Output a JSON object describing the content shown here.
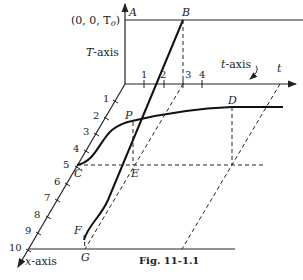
{
  "figure": {
    "caption": "Fig. 11-1.1",
    "origin_label": "(0, 0, T",
    "origin_sub": "0",
    "origin_close": ")",
    "axes": {
      "T_axis": "T-axis",
      "t_axis": "t-axis",
      "t_end": "t",
      "x_axis_var": "x",
      "x_axis_suffix": "-axis"
    },
    "t_ticks": [
      "1",
      "2",
      "3",
      "4"
    ],
    "x_ticks": [
      "1",
      "2",
      "3",
      "4",
      "5",
      "6",
      "7",
      "8",
      "9",
      "10"
    ],
    "points": {
      "A": "A",
      "B": "B",
      "C": "C",
      "D": "D",
      "E": "E",
      "F": "F",
      "G": "G",
      "P": "P"
    }
  }
}
